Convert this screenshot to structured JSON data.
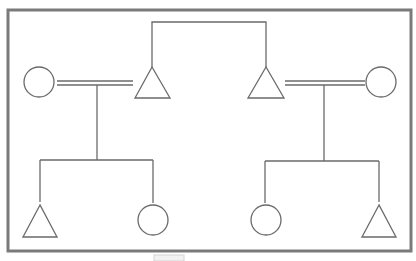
{
  "diagram": {
    "type": "genogram",
    "colors": {
      "frame": "#7a7a7a",
      "line": "#6a6a6a",
      "background": "#ffffff"
    },
    "legend": {
      "triangle": "male",
      "circle": "female",
      "double_line": "marriage"
    },
    "generation_1": [
      {
        "id": "left-wife",
        "shape": "circle"
      },
      {
        "id": "left-husband",
        "shape": "triangle"
      },
      {
        "id": "right-husband",
        "shape": "triangle"
      },
      {
        "id": "right-wife",
        "shape": "circle"
      }
    ],
    "sibling_link": [
      "left-husband",
      "right-husband"
    ],
    "marriages": [
      [
        "left-wife",
        "left-husband"
      ],
      [
        "right-husband",
        "right-wife"
      ]
    ],
    "generation_2": [
      {
        "id": "left-child-1",
        "shape": "triangle",
        "parents": "left-couple"
      },
      {
        "id": "left-child-2",
        "shape": "circle",
        "parents": "left-couple"
      },
      {
        "id": "right-child-1",
        "shape": "circle",
        "parents": "right-couple"
      },
      {
        "id": "right-child-2",
        "shape": "triangle",
        "parents": "right-couple"
      }
    ]
  }
}
